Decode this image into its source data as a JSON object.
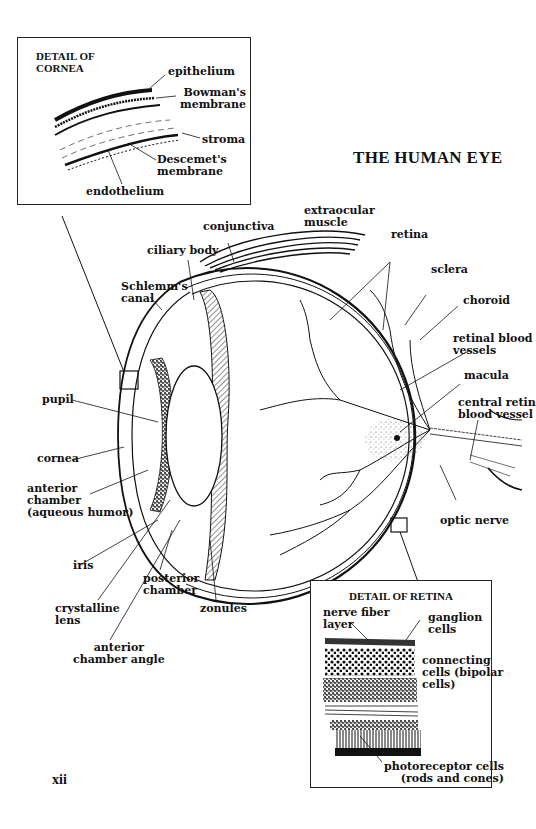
{
  "title": "THE HUMAN EYE",
  "page_number": "xii",
  "cornea_detail": {
    "title": "DETAIL OF\nCORNEA",
    "labels": {
      "epithelium": "epithelium",
      "bowmans": "Bowman's\nmembrane",
      "stroma": "stroma",
      "descemets": "Descemet's\nmembrane",
      "endothelium": "endothelium"
    }
  },
  "eye_labels": {
    "conjunctiva": "conjunctiva",
    "extraocular_muscle": "extraocular\nmuscle",
    "retina": "retina",
    "ciliary_body": "ciliary body",
    "schlemms_canal": "Schlemm's\ncanal",
    "sclera": "sclera",
    "choroid": "choroid",
    "retinal_blood_vessels": "retinal blood\nvessels",
    "macula": "macula",
    "central_retinal_blood_vessel": "central retin\nblood vessel",
    "pupil": "pupil",
    "cornea": "cornea",
    "anterior_chamber": "anterior\nchamber\n(aqueous humor)",
    "optic_nerve": "optic nerve",
    "iris": "iris",
    "posterior_chamber": "posterior\nchamber",
    "crystalline_lens": "crystalline\nlens",
    "zonules": "zonules",
    "anterior_chamber_angle": "anterior\nchamber angle"
  },
  "retina_detail": {
    "title": "DETAIL OF RETINA",
    "labels": {
      "nerve_fiber_layer": "nerve fiber\nlayer",
      "ganglion_cells": "ganglion\ncells",
      "connecting_cells": "connecting\ncells (bipolar\ncells)",
      "photoreceptor_cells": "photoreceptor cells\n(rods and cones)"
    }
  }
}
